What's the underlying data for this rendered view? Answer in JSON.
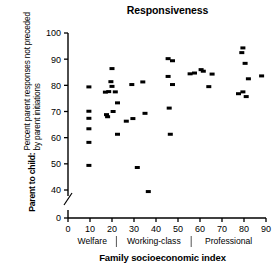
{
  "chart_data": {
    "type": "scatter",
    "title": "Responsiveness",
    "xlabel": "Family socioeconomic index",
    "ylabel_bold": "Parent to child:",
    "ylabel_line1": "Percent parent responses not preceded",
    "ylabel_line2": "by parent initiations",
    "xlim": [
      0,
      90
    ],
    "ylim": [
      40,
      100
    ],
    "y_axis_break": true,
    "y_zero_shown": true,
    "grid": false,
    "legend": "none",
    "marker": "filled-square",
    "marker_color": "#000000",
    "xticks": [
      0,
      10,
      20,
      30,
      40,
      50,
      60,
      70,
      80,
      90
    ],
    "xtick_labels": [
      "0",
      "10",
      "20",
      "30",
      "40",
      "50",
      "60",
      "70",
      "80",
      "90"
    ],
    "yticks": [
      0,
      40,
      50,
      60,
      70,
      80,
      90,
      100
    ],
    "ytick_labels": [
      "0",
      "40",
      "50",
      "60",
      "70",
      "80",
      "90",
      "100"
    ],
    "group_bands": [
      {
        "label": "Welfare",
        "x_start": 0,
        "x_end": 22
      },
      {
        "label": "Working-class",
        "x_start": 22,
        "x_end": 56
      },
      {
        "label": "Professional",
        "x_start": 56,
        "x_end": 90
      }
    ],
    "points": [
      {
        "x": 9.5,
        "y": 79.4
      },
      {
        "x": 9.5,
        "y": 70.1
      },
      {
        "x": 9.5,
        "y": 67.4
      },
      {
        "x": 9.5,
        "y": 63.4
      },
      {
        "x": 9.5,
        "y": 58.2
      },
      {
        "x": 9.5,
        "y": 49.4
      },
      {
        "x": 17.0,
        "y": 77.4
      },
      {
        "x": 17.5,
        "y": 68.8
      },
      {
        "x": 18.0,
        "y": 68.0
      },
      {
        "x": 18.5,
        "y": 77.6
      },
      {
        "x": 19.5,
        "y": 81.4
      },
      {
        "x": 20.0,
        "y": 86.4
      },
      {
        "x": 20.0,
        "y": 79.6
      },
      {
        "x": 20.5,
        "y": 70.0
      },
      {
        "x": 21.5,
        "y": 77.5
      },
      {
        "x": 22.5,
        "y": 73.3
      },
      {
        "x": 22.5,
        "y": 61.3
      },
      {
        "x": 26.5,
        "y": 66.3
      },
      {
        "x": 29.0,
        "y": 80.3
      },
      {
        "x": 29.5,
        "y": 67.3
      },
      {
        "x": 31.5,
        "y": 48.6
      },
      {
        "x": 34.0,
        "y": 81.3
      },
      {
        "x": 35.0,
        "y": 69.3
      },
      {
        "x": 36.5,
        "y": 39.4
      },
      {
        "x": 45.5,
        "y": 90.2
      },
      {
        "x": 45.5,
        "y": 83.4
      },
      {
        "x": 46.0,
        "y": 71.3
      },
      {
        "x": 46.5,
        "y": 61.3
      },
      {
        "x": 47.5,
        "y": 89.4
      },
      {
        "x": 47.5,
        "y": 80.3
      },
      {
        "x": 55.5,
        "y": 84.4
      },
      {
        "x": 57.5,
        "y": 84.7
      },
      {
        "x": 60.5,
        "y": 86.0
      },
      {
        "x": 61.5,
        "y": 85.4
      },
      {
        "x": 64.0,
        "y": 79.5
      },
      {
        "x": 65.5,
        "y": 84.3
      },
      {
        "x": 77.5,
        "y": 76.8
      },
      {
        "x": 79.0,
        "y": 92.5
      },
      {
        "x": 79.5,
        "y": 94.3
      },
      {
        "x": 79.5,
        "y": 77.5
      },
      {
        "x": 80.5,
        "y": 88.4
      },
      {
        "x": 81.0,
        "y": 75.7
      },
      {
        "x": 82.0,
        "y": 82.5
      },
      {
        "x": 88.0,
        "y": 83.6
      }
    ]
  }
}
